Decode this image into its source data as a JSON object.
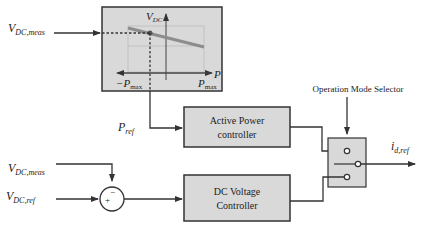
{
  "inputs": {
    "vdc_meas_top": {
      "main": "V",
      "sub": "DC,meas"
    },
    "vdc_meas_bottom": {
      "main": "V",
      "sub": "DC,meas"
    },
    "vdc_ref": {
      "main": "V",
      "sub": "DC,ref"
    }
  },
  "droop_plot": {
    "y_axis": {
      "main": "V",
      "sub": "DC"
    },
    "x_axis": "P",
    "neg_limit": {
      "main": "−P",
      "sub": "max"
    },
    "pos_limit": {
      "main": "P",
      "sub": "max"
    }
  },
  "signals": {
    "p_ref": {
      "main": "P",
      "sub": "ref"
    },
    "output": {
      "main": "i",
      "sub": "d,ref"
    }
  },
  "blocks": {
    "active_power": {
      "line1": "Active Power",
      "line2": "controller"
    },
    "dc_voltage": {
      "line1": "DC Voltage",
      "line2": "Controller"
    }
  },
  "selector": {
    "label": "Operation Mode Selector"
  },
  "summing_junction": {
    "plus": "+",
    "minus": "−"
  },
  "colors": {
    "block_fill": "#d9d9d9",
    "line": "#333333",
    "droop_line": "#8c8c8c",
    "grid": "#b0b0b0"
  }
}
